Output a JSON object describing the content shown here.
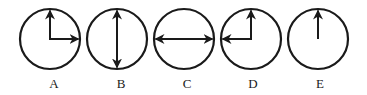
{
  "figure": {
    "stroke_color": "#1a1a1a",
    "background": "#ffffff",
    "clocks": [
      {
        "label": "A",
        "cx": 50,
        "cy": 39,
        "r": 30,
        "hands": [
          {
            "direction": "up",
            "from": "center",
            "to": "edge",
            "arrow": "end"
          },
          {
            "direction": "right",
            "from": "center",
            "to": "edge",
            "arrow": "end"
          }
        ],
        "description": "Right-angle hands: one up, one right (like 3 o'clock)"
      },
      {
        "label": "B",
        "cx": 117,
        "cy": 39,
        "r": 30,
        "hands": [
          {
            "direction": "vertical",
            "from": "top-edge",
            "to": "bottom-edge",
            "arrow": "both"
          }
        ],
        "description": "Double-headed vertical arrow spanning the diameter"
      },
      {
        "label": "C",
        "cx": 184,
        "cy": 39,
        "r": 30,
        "hands": [
          {
            "direction": "horizontal",
            "from": "left-edge",
            "to": "right-edge",
            "arrow": "both"
          }
        ],
        "description": "Double-headed horizontal arrow spanning the diameter"
      },
      {
        "label": "D",
        "cx": 251,
        "cy": 39,
        "r": 30,
        "hands": [
          {
            "direction": "up",
            "from": "center",
            "to": "edge",
            "arrow": "end"
          },
          {
            "direction": "left",
            "from": "center",
            "to": "edge",
            "arrow": "end"
          }
        ],
        "description": "Right-angle hands: one up, one left (like 9 o'clock)"
      },
      {
        "label": "E",
        "cx": 318,
        "cy": 39,
        "r": 30,
        "hands": [
          {
            "direction": "up",
            "from": "center",
            "to": "edge",
            "arrow": "end"
          }
        ],
        "description": "Single hand pointing up"
      }
    ]
  },
  "labels": {
    "a": "A",
    "b": "B",
    "c": "C",
    "d": "D",
    "e": "E"
  }
}
